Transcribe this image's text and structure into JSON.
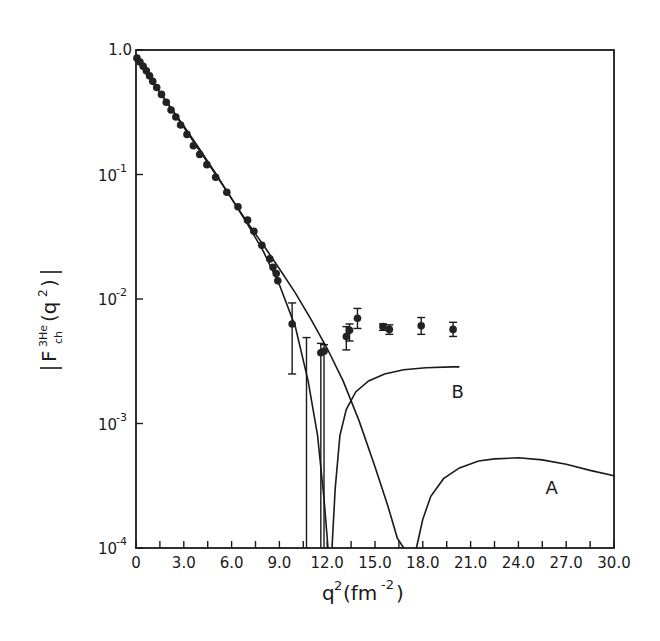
{
  "chart_data": {
    "type": "scatter",
    "title": "",
    "xlabel": "q²(fm⁻²)",
    "ylabel": "|F_ch^3He(q²)|",
    "xlim": [
      0,
      30
    ],
    "ylim": [
      0.0001,
      1.0
    ],
    "yscale": "log",
    "grid": false,
    "x_ticks": [
      0,
      3.0,
      6.0,
      9.0,
      12.0,
      15.0,
      18.0,
      21.0,
      24.0,
      27.0,
      30.0
    ],
    "x_tick_labels": [
      "0",
      "3.0",
      "6.0",
      "9.0",
      "12.0",
      "15.0",
      "18.0",
      "21.0",
      "24.0",
      "27.0",
      "30.0"
    ],
    "y_ticks": [
      1.0,
      0.1,
      0.01,
      0.001,
      0.0001
    ],
    "y_tick_labels": [
      "1.0",
      "10^-1",
      "10^-2",
      "10^-3",
      "10^-4"
    ],
    "series": [
      {
        "name": "data",
        "kind": "points_with_errorbars",
        "points": [
          {
            "x": 0.06,
            "y": 0.86
          },
          {
            "x": 0.25,
            "y": 0.8
          },
          {
            "x": 0.45,
            "y": 0.74
          },
          {
            "x": 0.65,
            "y": 0.68
          },
          {
            "x": 0.85,
            "y": 0.62
          },
          {
            "x": 1.05,
            "y": 0.56
          },
          {
            "x": 1.3,
            "y": 0.5
          },
          {
            "x": 1.6,
            "y": 0.44
          },
          {
            "x": 1.9,
            "y": 0.38
          },
          {
            "x": 2.2,
            "y": 0.33
          },
          {
            "x": 2.5,
            "y": 0.29
          },
          {
            "x": 2.8,
            "y": 0.25
          },
          {
            "x": 3.2,
            "y": 0.21
          },
          {
            "x": 3.6,
            "y": 0.17
          },
          {
            "x": 4.0,
            "y": 0.145
          },
          {
            "x": 4.45,
            "y": 0.12
          },
          {
            "x": 5.0,
            "y": 0.095
          },
          {
            "x": 5.7,
            "y": 0.072
          },
          {
            "x": 6.4,
            "y": 0.055
          },
          {
            "x": 7.0,
            "y": 0.043
          },
          {
            "x": 7.4,
            "y": 0.035
          },
          {
            "x": 7.9,
            "y": 0.027
          },
          {
            "x": 8.4,
            "y": 0.021
          },
          {
            "x": 8.6,
            "y": 0.018
          },
          {
            "x": 8.8,
            "y": 0.016
          },
          {
            "x": 8.9,
            "y": 0.014
          },
          {
            "x": 9.8,
            "y": 0.0063,
            "err_lo": 0.0025,
            "err_hi": 0.0093
          },
          {
            "x": 10.7,
            "y": 0.0001,
            "err_lo": 0.0001,
            "err_hi": 0.0049
          },
          {
            "x": 11.6,
            "y": 0.0037,
            "err_lo": 0.0001,
            "err_hi": 0.0044
          },
          {
            "x": 11.8,
            "y": 0.0038,
            "err_lo": 0.0001,
            "err_hi": 0.0043
          },
          {
            "x": 13.2,
            "y": 0.005,
            "err_lo": 0.0039,
            "err_hi": 0.006
          },
          {
            "x": 13.4,
            "y": 0.0056,
            "err_lo": 0.0046,
            "err_hi": 0.0063
          },
          {
            "x": 13.9,
            "y": 0.007,
            "err_lo": 0.0058,
            "err_hi": 0.0084
          },
          {
            "x": 15.5,
            "y": 0.006,
            "err_lo": 0.0056,
            "err_hi": 0.0063
          },
          {
            "x": 15.9,
            "y": 0.0057,
            "err_lo": 0.0052,
            "err_hi": 0.0062
          },
          {
            "x": 17.9,
            "y": 0.0061,
            "err_lo": 0.0052,
            "err_hi": 0.0071
          },
          {
            "x": 19.9,
            "y": 0.0057,
            "err_lo": 0.005,
            "err_hi": 0.0065
          }
        ]
      },
      {
        "name": "A",
        "kind": "line",
        "points": [
          [
            0,
            0.86
          ],
          [
            1,
            0.56
          ],
          [
            2,
            0.37
          ],
          [
            3,
            0.24
          ],
          [
            4,
            0.155
          ],
          [
            5,
            0.1
          ],
          [
            6,
            0.064
          ],
          [
            7,
            0.041
          ],
          [
            8,
            0.027
          ],
          [
            9,
            0.0175
          ],
          [
            10,
            0.0112
          ],
          [
            11,
            0.0068
          ],
          [
            12,
            0.004
          ],
          [
            13,
            0.0022
          ],
          [
            14,
            0.00105
          ],
          [
            15,
            0.00045
          ],
          [
            15.8,
            0.00022
          ],
          [
            16.4,
            0.00012
          ],
          [
            16.8,
            0.0001
          ]
        ],
        "points2": [
          [
            17.6,
            0.0001
          ],
          [
            18.0,
            0.00017
          ],
          [
            18.5,
            0.00026
          ],
          [
            19.3,
            0.00036
          ],
          [
            20.3,
            0.00044
          ],
          [
            21.5,
            0.0005
          ],
          [
            22.5,
            0.00052
          ],
          [
            24.0,
            0.00053
          ],
          [
            25.5,
            0.00051
          ],
          [
            27.0,
            0.00047
          ],
          [
            28.5,
            0.00042
          ],
          [
            30.0,
            0.00038
          ]
        ],
        "label": "A",
        "label_pos": [
          25.7,
          0.00027
        ]
      },
      {
        "name": "B",
        "kind": "line",
        "points": [
          [
            0,
            0.86
          ],
          [
            1,
            0.56
          ],
          [
            2,
            0.37
          ],
          [
            3,
            0.245
          ],
          [
            4,
            0.16
          ],
          [
            5,
            0.102
          ],
          [
            6,
            0.064
          ],
          [
            7,
            0.04
          ],
          [
            8,
            0.024
          ],
          [
            9,
            0.013
          ],
          [
            10,
            0.006
          ],
          [
            10.8,
            0.0022
          ],
          [
            11.4,
            0.0008
          ],
          [
            11.8,
            0.00025
          ],
          [
            12.05,
            0.0001
          ]
        ],
        "points2": [
          [
            12.3,
            0.0001
          ],
          [
            12.5,
            0.0003
          ],
          [
            12.8,
            0.0008
          ],
          [
            13.2,
            0.0013
          ],
          [
            13.8,
            0.0018
          ],
          [
            14.6,
            0.0022
          ],
          [
            15.6,
            0.0025
          ],
          [
            16.8,
            0.0027
          ],
          [
            18.2,
            0.0028
          ],
          [
            19.8,
            0.00285
          ],
          [
            20.3,
            0.00285
          ]
        ],
        "label": "B",
        "label_pos": [
          19.8,
          0.0016
        ]
      }
    ]
  }
}
